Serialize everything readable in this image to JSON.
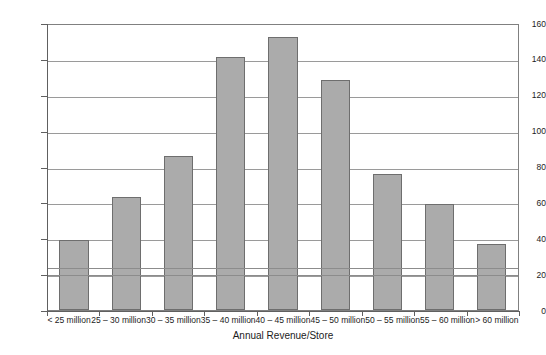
{
  "chart_data": {
    "type": "bar",
    "title": "",
    "xlabel": "Annual Revenue/Store",
    "ylabel": "",
    "categories": [
      "< 25 million",
      "25 – 30 million",
      "30 – 35 million",
      "35 – 40 million",
      "40 – 45 million",
      "45 – 50 million",
      "50 – 55 million",
      "55 – 60 million",
      "> 60 million"
    ],
    "values": [
      39,
      63,
      86,
      141,
      152,
      128,
      76,
      59,
      37
    ],
    "ylim": [
      0,
      160
    ],
    "yticks": [
      0,
      20,
      40,
      60,
      80,
      100,
      120,
      140,
      160
    ],
    "ytick_labels": [
      "0",
      "20",
      "40",
      "60",
      "80",
      "100",
      "120",
      "140",
      "160"
    ],
    "grid": true,
    "legend": false,
    "reference_lines": [
      20.5,
      24.5
    ],
    "bar_color": "#ababab",
    "bar_border_color": "#6e6e6e",
    "grid_color": "#9a9a9a",
    "axis_color": "#606060"
  }
}
